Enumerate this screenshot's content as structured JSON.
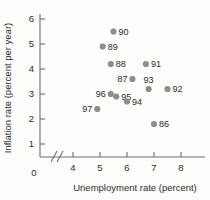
{
  "chart_data": {
    "type": "scatter",
    "title": "",
    "xlabel": "Unemployment rate (percent)",
    "ylabel": "Inflation rate (percent per year)",
    "xlim": [
      3.5,
      8.7
    ],
    "ylim": [
      0,
      6.4
    ],
    "x_ticks": [
      4,
      5,
      6,
      7,
      8
    ],
    "y_ticks": [
      1,
      2,
      3,
      4,
      5,
      6
    ],
    "origin_label": "0",
    "grid": false,
    "legend": null,
    "axis_break": {
      "x": true,
      "y": false
    },
    "marker_color": "#8d8d8d",
    "points": [
      {
        "label": "90",
        "x": 5.5,
        "y": 5.5,
        "label_side": "right"
      },
      {
        "label": "89",
        "x": 5.1,
        "y": 4.9,
        "label_side": "right"
      },
      {
        "label": "88",
        "x": 5.4,
        "y": 4.2,
        "label_side": "right"
      },
      {
        "label": "91",
        "x": 6.7,
        "y": 4.2,
        "label_side": "right"
      },
      {
        "label": "87",
        "x": 6.2,
        "y": 3.6,
        "label_side": "left"
      },
      {
        "label": "93",
        "x": 6.8,
        "y": 3.2,
        "label_side": "above"
      },
      {
        "label": "92",
        "x": 7.5,
        "y": 3.2,
        "label_side": "right"
      },
      {
        "label": "96",
        "x": 5.4,
        "y": 3.0,
        "label_side": "left"
      },
      {
        "label": "95",
        "x": 5.6,
        "y": 2.9,
        "label_side": "right"
      },
      {
        "label": "94",
        "x": 6.0,
        "y": 2.7,
        "label_side": "right"
      },
      {
        "label": "97",
        "x": 4.9,
        "y": 2.4,
        "label_side": "left"
      },
      {
        "label": "86",
        "x": 7.0,
        "y": 1.8,
        "label_side": "right"
      }
    ]
  }
}
